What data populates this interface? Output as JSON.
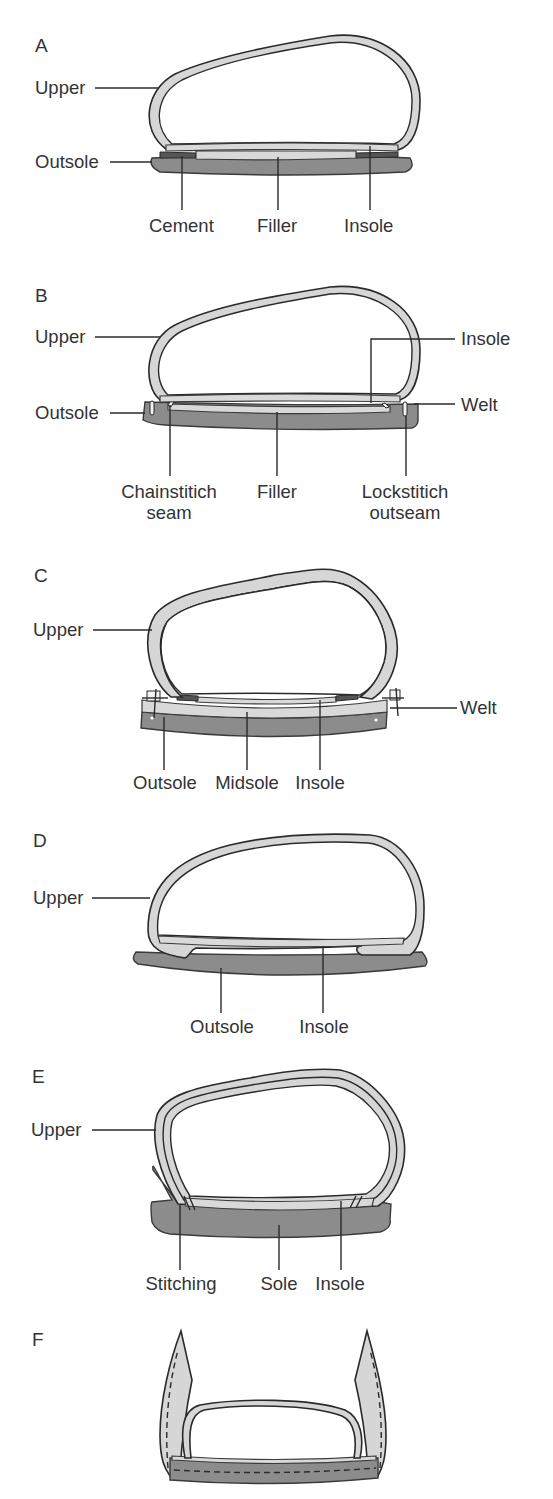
{
  "figure": {
    "colors": {
      "outsole_fill": "#8c8c8c",
      "upper_fill": "#d6d6d6",
      "light_layer_fill": "#d9d9d9",
      "outline": "#2a2a2a",
      "label_text": "#333333",
      "background": "#ffffff"
    },
    "panels": [
      {
        "letter": "A",
        "labels": {
          "upper": "Upper",
          "outsole": "Outsole",
          "cement": "Cement",
          "filler": "Filler",
          "insole": "Insole"
        }
      },
      {
        "letter": "B",
        "labels": {
          "upper": "Upper",
          "outsole": "Outsole",
          "insole": "Insole",
          "welt": "Welt",
          "chainstitch_line1": "Chainstitich",
          "chainstitch_line2": "seam",
          "filler": "Filler",
          "lockstitch_line1": "Lockstitich",
          "lockstitch_line2": "outseam"
        }
      },
      {
        "letter": "C",
        "labels": {
          "upper": "Upper",
          "welt": "Welt",
          "outsole": "Outsole",
          "midsole": "Midsole",
          "insole": "Insole"
        }
      },
      {
        "letter": "D",
        "labels": {
          "upper": "Upper",
          "outsole": "Outsole",
          "insole": "Insole"
        }
      },
      {
        "letter": "E",
        "labels": {
          "upper": "Upper",
          "stitching": "Stitching",
          "sole": "Sole",
          "insole": "Insole"
        }
      },
      {
        "letter": "F",
        "labels": {}
      }
    ]
  }
}
